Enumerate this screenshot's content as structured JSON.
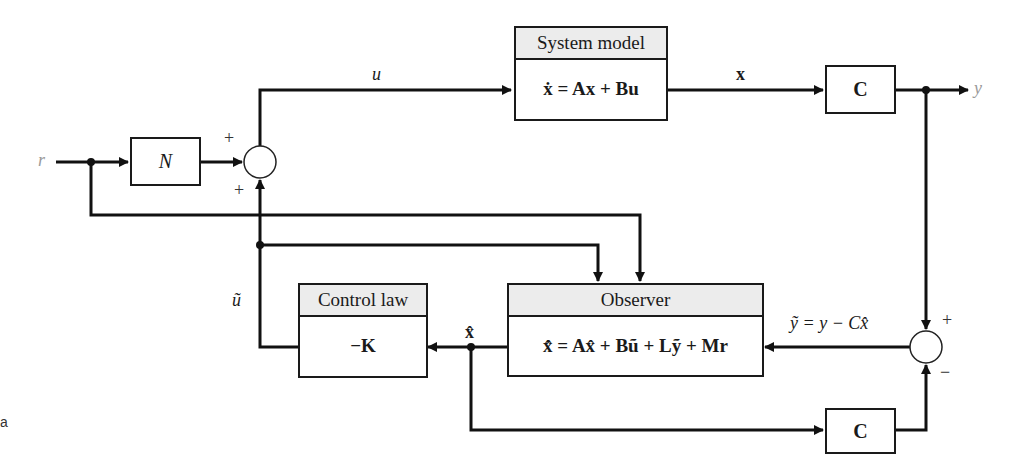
{
  "diagram": {
    "type": "block-diagram",
    "title": "",
    "blocks": {
      "system_model": {
        "header": "System model",
        "equation": "ẋ = Ax + Bu"
      },
      "output_matrix_top": {
        "label": "C"
      },
      "gain_n": {
        "label": "N"
      },
      "control_law": {
        "header": "Control law",
        "body": "−K"
      },
      "observer": {
        "header": "Observer",
        "equation": "x̂̇ = Ax̂ + Bũ + Lỹ + Mr"
      },
      "output_matrix_bottom": {
        "label": "C"
      }
    },
    "signals": {
      "reference": "r",
      "control_input": "u",
      "state": "x",
      "output": "y",
      "control_feedback": "ũ",
      "state_estimate": "x̂",
      "output_error": "ỹ = y − Cx̂"
    },
    "summing_junctions": {
      "input_sum": {
        "top_sign": "+",
        "bottom_sign": "+"
      },
      "output_error_sum": {
        "top_sign": "+",
        "bottom_sign": "−"
      }
    },
    "corner_label": "a"
  }
}
